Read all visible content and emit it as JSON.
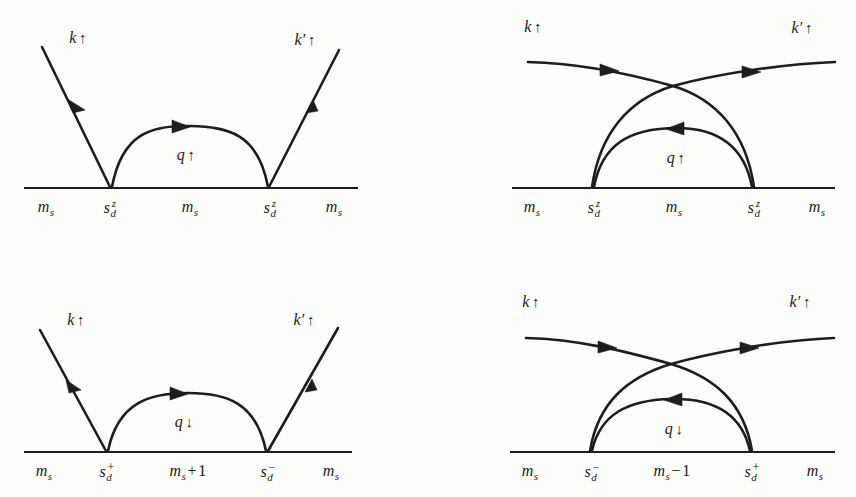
{
  "figure": {
    "type": "feynman-diagram-set",
    "background_color": "#fdfdfc",
    "line_color": "#1d1d1d",
    "panel_count": 4
  },
  "panels": [
    {
      "id": "top-left",
      "kind": "direct",
      "incoming_label": "k",
      "incoming_spin": "↑",
      "outgoing_label": "k′",
      "outgoing_spin": "↑",
      "propagator_label": "q",
      "propagator_spin": "↑",
      "baseline_segments": [
        {
          "text": "m",
          "sub": "s"
        },
        {
          "text": "s",
          "sub": "d",
          "sup": "z"
        },
        {
          "text": "m",
          "sub": "s"
        },
        {
          "text": "s",
          "sub": "d",
          "sup": "z"
        },
        {
          "text": "m",
          "sub": "s"
        }
      ]
    },
    {
      "id": "top-right",
      "kind": "crossed",
      "incoming_label": "k",
      "incoming_spin": "↑",
      "outgoing_label": "k′",
      "outgoing_spin": "↑",
      "propagator_label": "q",
      "propagator_spin": "↑",
      "baseline_segments": [
        {
          "text": "m",
          "sub": "s"
        },
        {
          "text": "s",
          "sub": "d",
          "sup": "z"
        },
        {
          "text": "m",
          "sub": "s"
        },
        {
          "text": "s",
          "sub": "d",
          "sup": "z"
        },
        {
          "text": "m",
          "sub": "s"
        }
      ]
    },
    {
      "id": "bottom-left",
      "kind": "direct",
      "incoming_label": "k",
      "incoming_spin": "↑",
      "outgoing_label": "k′",
      "outgoing_spin": "↑",
      "propagator_label": "q",
      "propagator_spin": "↓",
      "baseline_segments": [
        {
          "text": "m",
          "sub": "s"
        },
        {
          "text": "s",
          "sub": "d",
          "supsign": "+"
        },
        {
          "text": "m",
          "sub": "s",
          "op": "+",
          "num": "1"
        },
        {
          "text": "s",
          "sub": "d",
          "supsign": "−"
        },
        {
          "text": "m",
          "sub": "s"
        }
      ]
    },
    {
      "id": "bottom-right",
      "kind": "crossed",
      "incoming_label": "k",
      "incoming_spin": "↑",
      "outgoing_label": "k′",
      "outgoing_spin": "↑",
      "propagator_label": "q",
      "propagator_spin": "↓",
      "baseline_segments": [
        {
          "text": "m",
          "sub": "s"
        },
        {
          "text": "s",
          "sub": "d",
          "supsign": "−"
        },
        {
          "text": "m",
          "sub": "s",
          "op": "−",
          "num": "1"
        },
        {
          "text": "s",
          "sub": "d",
          "supsign": "+"
        },
        {
          "text": "m",
          "sub": "s"
        }
      ]
    }
  ],
  "labels": {
    "tl_k": "k",
    "tl_k_spin": "↑",
    "tl_kp": "k",
    "tl_kp_prime": "′",
    "tl_kp_spin": "↑",
    "tl_q": "q",
    "tl_q_spin": "↑",
    "tl_b0_m": "m",
    "tl_b0_s": "s",
    "tl_b1_s": "s",
    "tl_b1_d": "d",
    "tl_b1_z": "z",
    "tl_b2_m": "m",
    "tl_b2_s": "s",
    "tl_b3_s": "s",
    "tl_b3_d": "d",
    "tl_b3_z": "z",
    "tl_b4_m": "m",
    "tl_b4_s": "s",
    "tr_k": "k",
    "tr_k_spin": "↑",
    "tr_kp": "k",
    "tr_kp_prime": "′",
    "tr_kp_spin": "↑",
    "tr_q": "q",
    "tr_q_spin": "↑",
    "tr_b0_m": "m",
    "tr_b0_s": "s",
    "tr_b1_s": "s",
    "tr_b1_d": "d",
    "tr_b1_z": "z",
    "tr_b2_m": "m",
    "tr_b2_s": "s",
    "tr_b3_s": "s",
    "tr_b3_d": "d",
    "tr_b3_z": "z",
    "tr_b4_m": "m",
    "tr_b4_s": "s",
    "bl_k": "k",
    "bl_k_spin": "↑",
    "bl_kp": "k",
    "bl_kp_prime": "′",
    "bl_kp_spin": "↑",
    "bl_q": "q",
    "bl_q_spin": "↓",
    "bl_b0_m": "m",
    "bl_b0_s": "s",
    "bl_b1_s": "s",
    "bl_b1_d": "d",
    "bl_b1_sign": "+",
    "bl_b2_m": "m",
    "bl_b2_s": "s",
    "bl_b2_op": "+",
    "bl_b2_num": "1",
    "bl_b3_s": "s",
    "bl_b3_d": "d",
    "bl_b3_sign": "−",
    "bl_b4_m": "m",
    "bl_b4_s": "s",
    "br_k": "k",
    "br_k_spin": "↑",
    "br_kp": "k",
    "br_kp_prime": "′",
    "br_kp_spin": "↑",
    "br_q": "q",
    "br_q_spin": "↓",
    "br_b0_m": "m",
    "br_b0_s": "s",
    "br_b1_s": "s",
    "br_b1_d": "d",
    "br_b1_sign": "−",
    "br_b2_m": "m",
    "br_b2_s": "s",
    "br_b2_op": "−",
    "br_b2_num": "1",
    "br_b3_s": "s",
    "br_b3_d": "d",
    "br_b3_sign": "+",
    "br_b4_m": "m",
    "br_b4_s": "s"
  }
}
